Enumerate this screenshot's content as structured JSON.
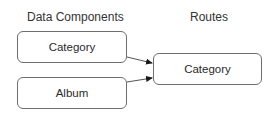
{
  "diagram": {
    "columns": [
      {
        "id": "data-components",
        "heading": "Data Components"
      },
      {
        "id": "routes",
        "heading": "Routes"
      }
    ],
    "nodes": [
      {
        "id": "dc-category",
        "column": "data-components",
        "label": "Category"
      },
      {
        "id": "dc-album",
        "column": "data-components",
        "label": "Album"
      },
      {
        "id": "route-category",
        "column": "routes",
        "label": "Category"
      }
    ],
    "edges": [
      {
        "from": "dc-category",
        "to": "route-category"
      },
      {
        "from": "dc-album",
        "to": "route-category"
      }
    ],
    "colors": {
      "stroke": "#6e6e6e",
      "arrow": "#1a1a1a",
      "text": "#2a2a2a"
    }
  }
}
